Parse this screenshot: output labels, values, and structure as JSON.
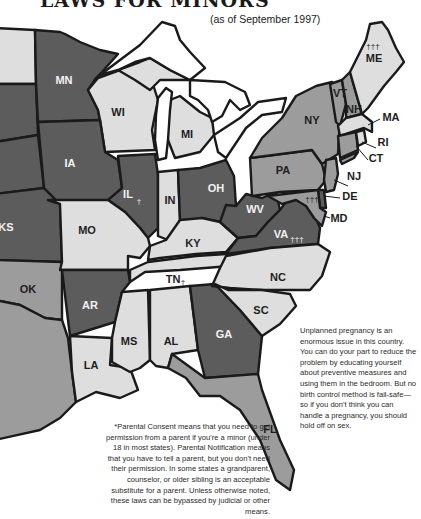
{
  "title": "LAWS FOR MINORS",
  "subtitle": "(as of September 1997)",
  "colors": {
    "dark": "#5c5c5c",
    "medium": "#9c9c9c",
    "light": "#dedede",
    "outline": "#1a1a1a"
  },
  "states": {
    "MN": {
      "label": "MN",
      "shade": "dark"
    },
    "WI": {
      "label": "WI",
      "shade": "light"
    },
    "MI": {
      "label": "MI",
      "shade": "light"
    },
    "IA": {
      "label": "IA",
      "shade": "dark"
    },
    "IL": {
      "label": "IL",
      "shade": "dark",
      "mark": "†"
    },
    "IN": {
      "label": "IN",
      "shade": "light"
    },
    "OH": {
      "label": "OH",
      "shade": "dark"
    },
    "KS": {
      "label": "KS",
      "shade": "dark"
    },
    "MO": {
      "label": "MO",
      "shade": "light"
    },
    "KY": {
      "label": "KY",
      "shade": "light"
    },
    "WV": {
      "label": "WV",
      "shade": "dark"
    },
    "VA": {
      "label": "VA",
      "shade": "dark",
      "mark": "†††"
    },
    "OK": {
      "label": "OK",
      "shade": "medium"
    },
    "AR": {
      "label": "AR",
      "shade": "dark"
    },
    "TN": {
      "label": "TN",
      "shade": "light",
      "mark": "†"
    },
    "NC": {
      "label": "NC",
      "shade": "light"
    },
    "SC": {
      "label": "SC",
      "shade": "light"
    },
    "MS": {
      "label": "MS",
      "shade": "light"
    },
    "AL": {
      "label": "AL",
      "shade": "light"
    },
    "GA": {
      "label": "GA",
      "shade": "dark"
    },
    "LA": {
      "label": "LA",
      "shade": "light"
    },
    "FL": {
      "label": "FL",
      "shade": "medium"
    },
    "TX": {
      "label": "",
      "shade": "medium"
    },
    "ND": {
      "label": "",
      "shade": "light"
    },
    "SD": {
      "label": "",
      "shade": "dark"
    },
    "NE": {
      "label": "",
      "shade": "dark"
    },
    "NY": {
      "label": "NY",
      "shade": "medium"
    },
    "PA": {
      "label": "PA",
      "shade": "medium"
    },
    "VT": {
      "label": "VT",
      "shade": "medium"
    },
    "NH": {
      "label": "NH",
      "shade": "medium"
    },
    "ME": {
      "label": "ME",
      "shade": "light",
      "mark": "†††"
    },
    "MA": {
      "label": "MA",
      "shade": "light"
    },
    "RI": {
      "label": "RI",
      "shade": "light"
    },
    "CT": {
      "label": "CT",
      "shade": "medium"
    },
    "NJ": {
      "label": "NJ",
      "shade": "medium"
    },
    "DE": {
      "label": "DE",
      "shade": "dark"
    },
    "MD": {
      "label": "MD",
      "shade": "medium",
      "mark": "†††"
    }
  },
  "notes": {
    "right": "Unplanned pregnancy is an enormous issue in this country. You can do your part to reduce the problem by educating yourself about preventive measures and using them in the bedroom. But no birth control method is fail-safe—so if you don't think you can handle a pregnancy, you should hold off on sex.",
    "bottom": "*Parental Consent means that you need to get permission from a parent if you're a minor (under 18 in most states). Parental Notification means that you have to tell a parent, but you don't need their permission. In some states a grandparent, counselor, or older sibling is an acceptable substitute for a parent. Unless otherwise noted, these laws can be bypassed by judicial or other means."
  }
}
